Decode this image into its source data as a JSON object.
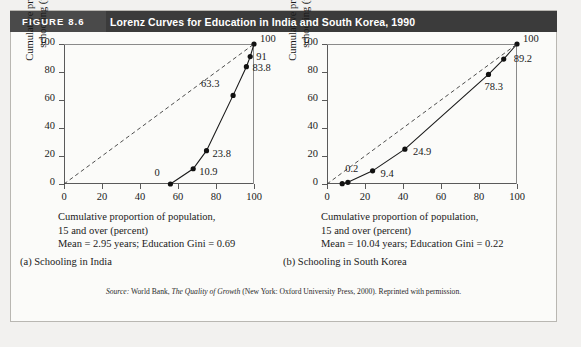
{
  "figure": {
    "number_label": "FIGURE 8.6",
    "title": "Lorenz Curves for Education in India and South Korea, 1990",
    "source_prefix": "Source:",
    "source_text_1": "World Bank,",
    "source_title": "The Quality of Growth",
    "source_text_2": "(New York: Oxford University Press, 2000). Reprinted with permission.",
    "header_bg": "#3b3b3b",
    "header_accent_bg": "#4a4a4a",
    "header_text_color": "#ffffff"
  },
  "chart_data": [
    {
      "type": "line",
      "title": "(a) Schooling in India",
      "xlabel_line1": "Cumulative proportion of population,",
      "xlabel_line2": "15 and over (percent)",
      "note": "Mean = 2.95 years; Education Gini = 0.69",
      "mean_years": 2.95,
      "education_gini": 0.69,
      "xlim": [
        0,
        100
      ],
      "ylim": [
        0,
        100
      ],
      "xticks": [
        0,
        20,
        40,
        60,
        80,
        100
      ],
      "yticks": [
        0,
        20,
        40,
        60,
        80,
        100
      ],
      "grid": false,
      "legend": "none",
      "ylabel_line1": "Cumulative proportion of",
      "ylabel_line2": "schooling (percent)",
      "series": [
        {
          "name": "Lorenz curve (India)",
          "style": "solid-with-markers",
          "x": [
            56,
            68,
            75,
            89,
            96,
            98,
            100
          ],
          "y": [
            0,
            10.9,
            23.8,
            63.3,
            83.8,
            91,
            100
          ]
        },
        {
          "name": "Line of equality",
          "style": "dashed",
          "x": [
            0,
            100
          ],
          "y": [
            0,
            100
          ]
        }
      ],
      "point_labels": [
        {
          "text": "0",
          "x": 56,
          "y": 0
        },
        {
          "text": "10.9",
          "x": 68,
          "y": 10.9
        },
        {
          "text": "23.8",
          "x": 75,
          "y": 23.8
        },
        {
          "text": "63.3",
          "x": 89,
          "y": 63.3
        },
        {
          "text": "83.8",
          "x": 96,
          "y": 83.8
        },
        {
          "text": "91",
          "x": 98,
          "y": 91
        },
        {
          "text": "100",
          "x": 100,
          "y": 100
        }
      ]
    },
    {
      "type": "line",
      "title": "(b) Schooling in South Korea",
      "xlabel_line1": "Cumulative proportion of population,",
      "xlabel_line2": "15 and over (percent)",
      "note": "Mean = 10.04 years; Education Gini = 0.22",
      "mean_years": 10.04,
      "education_gini": 0.22,
      "xlim": [
        0,
        100
      ],
      "ylim": [
        0,
        100
      ],
      "xticks": [
        0,
        20,
        40,
        60,
        80,
        100
      ],
      "yticks": [
        0,
        20,
        40,
        60,
        80,
        100
      ],
      "grid": false,
      "legend": "none",
      "ylabel_line1": "Cumulative proportion of",
      "ylabel_line2": "schooling (percent)",
      "series": [
        {
          "name": "Lorenz curve (South Korea)",
          "style": "solid-with-markers",
          "x": [
            8,
            11,
            24,
            41,
            85,
            93,
            100
          ],
          "y": [
            0.2,
            1.2,
            9.4,
            24.9,
            78.3,
            89.2,
            100
          ]
        },
        {
          "name": "Line of equality",
          "style": "dashed",
          "x": [
            0,
            100
          ],
          "y": [
            0,
            100
          ]
        }
      ],
      "point_labels": [
        {
          "text": "0.2",
          "x": 8,
          "y": 0.2
        },
        {
          "text": "9.4",
          "x": 24,
          "y": 9.4
        },
        {
          "text": "24.9",
          "x": 41,
          "y": 24.9
        },
        {
          "text": "78.3",
          "x": 85,
          "y": 78.3
        },
        {
          "text": "89.2",
          "x": 93,
          "y": 89.2
        },
        {
          "text": "100",
          "x": 100,
          "y": 100
        }
      ]
    }
  ]
}
